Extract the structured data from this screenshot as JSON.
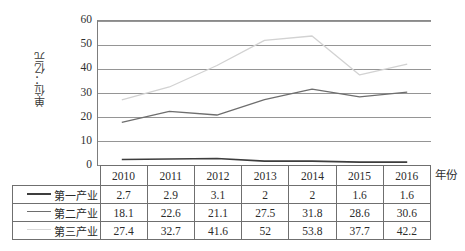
{
  "chart_data": {
    "type": "line",
    "title": "",
    "xlabel": "年份",
    "ylabel": "单位：亿元",
    "categories": [
      "2010",
      "2011",
      "2012",
      "2013",
      "2014",
      "2015",
      "2016"
    ],
    "ylim": [
      0,
      60
    ],
    "yticks": [
      60,
      50,
      40,
      30,
      20,
      10,
      0
    ],
    "grid": true,
    "legend_position": "table-left-column",
    "series": [
      {
        "name": "第一产业",
        "color": "#3d3d3d",
        "values": [
          2.7,
          2.9,
          3.1,
          2,
          2,
          1.6,
          1.6
        ]
      },
      {
        "name": "第二产业",
        "color": "#6e6e6e",
        "values": [
          18.1,
          22.6,
          21.1,
          27.5,
          31.8,
          28.6,
          30.6
        ]
      },
      {
        "name": "第三产业",
        "color": "#d2d2d2",
        "values": [
          27.4,
          32.7,
          41.6,
          52,
          53.8,
          37.7,
          42.2
        ]
      }
    ]
  },
  "axis": {
    "y_title": "单位：亿元",
    "x_title": "年份",
    "y_ticks": [
      "60",
      "50",
      "40",
      "30",
      "20",
      "10",
      "0"
    ]
  },
  "table": {
    "header_row": [
      "2010",
      "2011",
      "2012",
      "2013",
      "2014",
      "2015",
      "2016"
    ],
    "rows": [
      {
        "label": "第一产业",
        "swatch_color": "#3d3d3d",
        "swatch_width": 2,
        "cells": [
          "2.7",
          "2.9",
          "3.1",
          "2",
          "2",
          "1.6",
          "1.6"
        ]
      },
      {
        "label": "第二产业",
        "swatch_color": "#6e6e6e",
        "swatch_width": 1.5,
        "cells": [
          "18.1",
          "22.6",
          "21.1",
          "27.5",
          "31.8",
          "28.6",
          "30.6"
        ]
      },
      {
        "label": "第三产业",
        "swatch_color": "#d8d8d8",
        "swatch_width": 1.5,
        "cells": [
          "27.4",
          "32.7",
          "41.6",
          "52",
          "53.8",
          "37.7",
          "42.2"
        ]
      }
    ]
  },
  "colors": {
    "grid": "#8a8a8a",
    "axis": "#6f6f6f",
    "text": "#2b2b2b"
  }
}
